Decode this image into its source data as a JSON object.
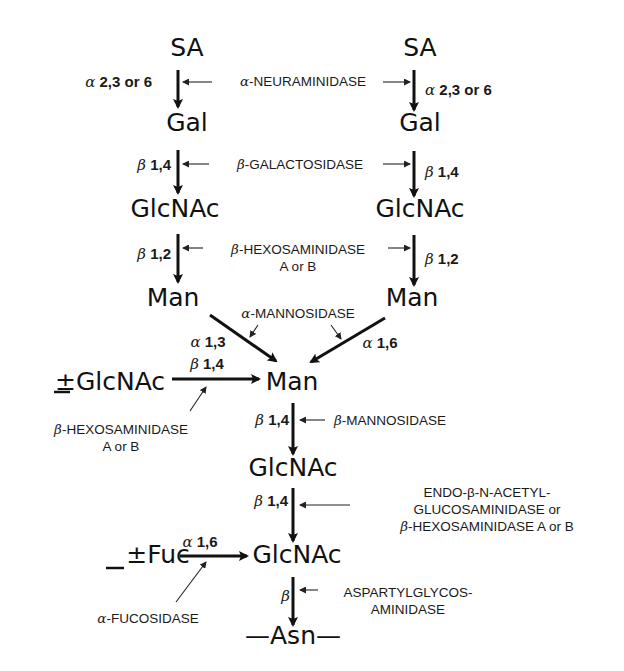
{
  "diagram": {
    "nodes": [
      {
        "id": "sa-left",
        "label": "SA",
        "x": 187,
        "y": 56
      },
      {
        "id": "sa-right",
        "label": "SA",
        "x": 420,
        "y": 56
      },
      {
        "id": "gal-left",
        "label": "Gal",
        "x": 187,
        "y": 131
      },
      {
        "id": "gal-right",
        "label": "Gal",
        "x": 420,
        "y": 131
      },
      {
        "id": "glcnac-left",
        "label": "GlcNAc",
        "x": 175,
        "y": 217
      },
      {
        "id": "glcnac-right",
        "label": "GlcNAc",
        "x": 420,
        "y": 217
      },
      {
        "id": "man-left",
        "label": "Man",
        "x": 173,
        "y": 306
      },
      {
        "id": "man-right",
        "label": "Man",
        "x": 412,
        "y": 306
      },
      {
        "id": "man-core",
        "label": "Man",
        "x": 292,
        "y": 390
      },
      {
        "id": "glcnac-bisect",
        "label": "GlcNAc",
        "x": 110,
        "y": 390,
        "prefix": "±"
      },
      {
        "id": "glcnac-core1",
        "label": "GlcNAc",
        "x": 293,
        "y": 476
      },
      {
        "id": "fuc",
        "label": "Fuc",
        "x": 158,
        "y": 563,
        "prefix": "±"
      },
      {
        "id": "glcnac-core2",
        "label": "GlcNAc",
        "x": 297,
        "y": 563
      },
      {
        "id": "asn",
        "label": "—Asn—",
        "x": 293,
        "y": 644
      }
    ],
    "linkages": [
      {
        "id": "sa-gal-left",
        "greek": "α",
        "text": " 2,3 or 6",
        "x": 152,
        "y": 87,
        "anchor": "end"
      },
      {
        "id": "sa-gal-right",
        "greek": "α",
        "text": " 2,3 or 6",
        "x": 425,
        "y": 95,
        "anchor": "start"
      },
      {
        "id": "gal-glcnac-left",
        "greek": "β",
        "text": " 1,4",
        "x": 171,
        "y": 170,
        "anchor": "end"
      },
      {
        "id": "gal-glcnac-right",
        "greek": "β",
        "text": " 1,4",
        "x": 425,
        "y": 177,
        "anchor": "start"
      },
      {
        "id": "glcnac-man-left",
        "greek": "β",
        "text": " 1,2",
        "x": 171,
        "y": 259,
        "anchor": "end"
      },
      {
        "id": "glcnac-man-right",
        "greek": "β",
        "text": " 1,2",
        "x": 425,
        "y": 264,
        "anchor": "start"
      },
      {
        "id": "man-man-a13",
        "greek": "α",
        "text": " 1,3",
        "x": 208,
        "y": 347,
        "anchor": "middle"
      },
      {
        "id": "man-man-a16",
        "greek": "α",
        "text": " 1,6",
        "x": 380,
        "y": 348,
        "anchor": "middle"
      },
      {
        "id": "bisect-b14",
        "greek": "β",
        "text": " 1,4",
        "x": 207,
        "y": 369,
        "anchor": "middle"
      },
      {
        "id": "man-glcnac",
        "greek": "β",
        "text": " 1,4",
        "x": 289,
        "y": 425,
        "anchor": "end"
      },
      {
        "id": "glcnac-glcnac",
        "greek": "β",
        "text": " 1,4",
        "x": 288,
        "y": 506,
        "anchor": "end"
      },
      {
        "id": "fuc-a16",
        "greek": "α",
        "text": " 1,6",
        "x": 200,
        "y": 547,
        "anchor": "middle"
      },
      {
        "id": "glcnac-asn",
        "greek": "β",
        "text": "",
        "x": 290,
        "y": 601,
        "anchor": "end"
      }
    ],
    "enzymes": [
      {
        "id": "neuraminidase",
        "lines": [
          {
            "greek": "α",
            "text": "-NEURAMINIDASE"
          }
        ],
        "x": 303,
        "y": 86
      },
      {
        "id": "galactosidase",
        "lines": [
          {
            "greek": "β",
            "text": "-GALACTOSIDASE"
          }
        ],
        "x": 300,
        "y": 169
      },
      {
        "id": "hexosaminidase-top",
        "lines": [
          {
            "greek": "β",
            "text": "-HEXOSAMINIDASE"
          },
          {
            "greek": "",
            "text": "A or B"
          }
        ],
        "x": 298,
        "y": 254
      },
      {
        "id": "mannosidase-alpha",
        "lines": [
          {
            "greek": "α",
            "text": "-MANNOSIDASE"
          }
        ],
        "x": 298,
        "y": 318
      },
      {
        "id": "hexosaminidase-bisect",
        "lines": [
          {
            "greek": "β",
            "text": "-HEXOSAMINIDASE"
          },
          {
            "greek": "",
            "text": "A or B"
          }
        ],
        "x": 121,
        "y": 434
      },
      {
        "id": "mannosidase-beta",
        "lines": [
          {
            "greek": "β",
            "text": "-MANNOSIDASE"
          }
        ],
        "x": 390,
        "y": 425
      },
      {
        "id": "endo-glucosaminidase",
        "lines": [
          {
            "greek": "",
            "text": "ENDO-β-N-ACETYL-"
          },
          {
            "greek": "",
            "text": "GLUCOSAMINIDASE or"
          },
          {
            "greek": "β",
            "text": "-HEXOSAMINIDASE A or B"
          }
        ],
        "x": 487,
        "y": 497
      },
      {
        "id": "fucosidase",
        "lines": [
          {
            "greek": "α",
            "text": "-FUCOSIDASE"
          }
        ],
        "x": 148,
        "y": 623
      },
      {
        "id": "aspartylglycosaminidase",
        "lines": [
          {
            "greek": "",
            "text": "ASPARTYLGLYCOS-"
          },
          {
            "greek": "",
            "text": "AMINIDASE"
          }
        ],
        "x": 408,
        "y": 597
      }
    ],
    "colors": {
      "ink": "#111111",
      "background": "#ffffff"
    }
  }
}
